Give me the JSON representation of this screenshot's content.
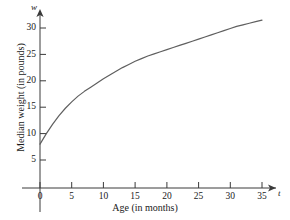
{
  "chart_data": {
    "type": "line",
    "title": "",
    "xlabel": "Age (in months)",
    "ylabel": "Median weight (in pounds)",
    "x_axis_variable": "t",
    "y_axis_variable": "w",
    "xlim": [
      0,
      37
    ],
    "ylim": [
      0,
      33
    ],
    "xticks": [
      0,
      5,
      10,
      15,
      20,
      25,
      30,
      35
    ],
    "yticks": [
      5,
      10,
      15,
      20,
      25,
      30
    ],
    "xtick_labels": [
      "0",
      "5",
      "10",
      "15",
      "20",
      "25",
      "30",
      "35"
    ],
    "ytick_labels": [
      "5",
      "10",
      "15",
      "20",
      "25",
      "30"
    ],
    "grid": false,
    "legend": false,
    "curve_color": "#5f5f5f",
    "axis_color": "#3a3a3a",
    "series": [
      {
        "name": "Median weight",
        "x": [
          0,
          1,
          2,
          3,
          4,
          5,
          6,
          7,
          8,
          9,
          10,
          11,
          12,
          13,
          14,
          15,
          16,
          17,
          18,
          19,
          20,
          21,
          22,
          23,
          24,
          25,
          26,
          27,
          28,
          29,
          30,
          31,
          32,
          33,
          34,
          35
        ],
        "values": [
          8.0,
          10.0,
          11.8,
          13.4,
          14.8,
          16.0,
          17.1,
          18.0,
          18.8,
          19.6,
          20.4,
          21.1,
          21.8,
          22.5,
          23.1,
          23.7,
          24.2,
          24.7,
          25.1,
          25.5,
          25.9,
          26.3,
          26.7,
          27.1,
          27.5,
          27.9,
          28.3,
          28.7,
          29.1,
          29.5,
          29.9,
          30.3,
          30.6,
          30.9,
          31.2,
          31.5
        ]
      }
    ]
  },
  "axis_titles": {
    "x": "Age (in months)",
    "y": "Median weight (in pounds)",
    "x_var": "t",
    "y_var": "w"
  }
}
